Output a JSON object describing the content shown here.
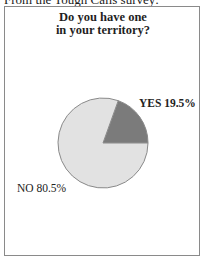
{
  "caption": "From the Tough Calls survey:",
  "chart_data": {
    "type": "pie",
    "title": "Do you have one in your territory?",
    "title_lines": [
      "Do you have one",
      "in your territory?"
    ],
    "categories": [
      "YES",
      "NO"
    ],
    "values": [
      19.5,
      80.5
    ],
    "unit": "%",
    "labels": [
      "YES 19.5%",
      "NO 80.5%"
    ],
    "colors": [
      "#7b7b7b",
      "#e2e2e2"
    ],
    "legend": "none",
    "grid": false
  },
  "colors": {
    "yes_slice": "#7b7b7b",
    "no_slice": "#e2e2e2",
    "outline": "#8a8a8a"
  }
}
